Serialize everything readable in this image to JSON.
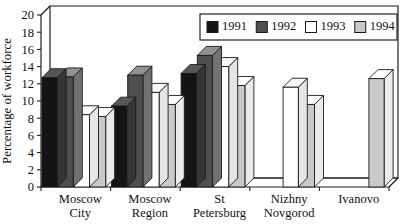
{
  "chart_data": {
    "type": "bar",
    "title": "",
    "subtitle": "",
    "xlabel": "",
    "ylabel": "Percentage of workforce",
    "ylim": [
      0,
      20
    ],
    "ytick_step": 2,
    "yticks": [
      "0",
      "2",
      "4",
      "6",
      "8",
      "10",
      "12",
      "14",
      "16",
      "18",
      "20"
    ],
    "grid": false,
    "style": "3d-bar",
    "legend_position": "top-right",
    "categories": [
      "Moscow City",
      "Moscow Region",
      "St Petersburg",
      "Nizhny Novgorod",
      "Ivanovo"
    ],
    "category_lines": [
      [
        "Moscow",
        "City"
      ],
      [
        "Moscow",
        "Region"
      ],
      [
        "St",
        "Petersburg"
      ],
      [
        "Nizhny",
        "Novgorod"
      ],
      [
        "Ivanovo",
        ""
      ]
    ],
    "series": [
      {
        "name": "1991",
        "color": "#141414",
        "values": [
          12.7,
          9.4,
          13.2,
          null,
          null
        ]
      },
      {
        "name": "1992",
        "color": "#4f4f4f",
        "values": [
          12.8,
          13.0,
          15.3,
          null,
          null
        ]
      },
      {
        "name": "1993",
        "color": "#ffffff",
        "values": [
          8.4,
          11.0,
          14.0,
          11.6,
          null
        ]
      },
      {
        "name": "1994",
        "color": "#c9c9c9",
        "values": [
          8.2,
          9.6,
          11.8,
          9.6,
          12.6
        ]
      }
    ]
  },
  "legend": {
    "entries": [
      {
        "label": "1991",
        "color": "#141414"
      },
      {
        "label": "1992",
        "color": "#4f4f4f"
      },
      {
        "label": "1993",
        "color": "#ffffff"
      },
      {
        "label": "1994",
        "color": "#c9c9c9"
      }
    ]
  },
  "axis": {
    "y_label": "Percentage of workforce"
  },
  "colors": {
    "axis": "#1a1a1a",
    "background": "#ffffff",
    "series_1991": "#141414",
    "series_1992": "#4f4f4f",
    "series_1993": "#ffffff",
    "series_1994": "#c9c9c9",
    "bar_top_tint": "#dedede",
    "bar_side_tint": "#9a9a9a"
  }
}
